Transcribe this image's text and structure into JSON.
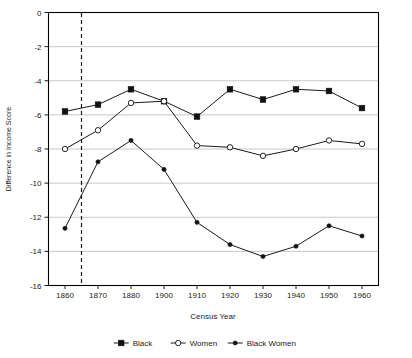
{
  "chart_data": {
    "type": "line",
    "title": "",
    "xlabel": "Census Year",
    "ylabel": "Difference in Income Score",
    "categories": [
      "1860",
      "1870",
      "1880",
      "1900",
      "1910",
      "1920",
      "1930",
      "1940",
      "1950",
      "1960"
    ],
    "x": [
      1860,
      1870,
      1880,
      1900,
      1910,
      1920,
      1930,
      1940,
      1950,
      1960
    ],
    "ylim": [
      -16,
      0
    ],
    "xlim_labels": [
      "1860",
      "1960"
    ],
    "yticks": [
      0,
      -2,
      -4,
      -6,
      -8,
      -10,
      -12,
      -14,
      -16
    ],
    "ytick_labels": [
      "0",
      "-2",
      "-4",
      "-6",
      "-8",
      "-10",
      "-12",
      "-14",
      "-16"
    ],
    "grid": true,
    "grid_axis": "y",
    "legend_position": "bottom",
    "annotations": [
      {
        "kind": "vertical-dashed-line",
        "x": 1865,
        "label": "",
        "note": "dashed reference line between 1860 and 1870"
      }
    ],
    "series": [
      {
        "name": "Black",
        "marker": "filled-square",
        "color": "#111111",
        "values": [
          -5.8,
          -5.4,
          -4.5,
          -5.2,
          -6.1,
          -4.5,
          -5.1,
          -4.5,
          -4.6,
          -5.6
        ]
      },
      {
        "name": "Women",
        "marker": "open-circle",
        "color": "#111111",
        "values": [
          -8.0,
          -6.9,
          -5.3,
          -5.2,
          -7.8,
          -7.9,
          -8.4,
          -8.0,
          -7.5,
          -7.7
        ]
      },
      {
        "name": "Black Women",
        "marker": "small-filled-circle",
        "color": "#111111",
        "values": [
          -12.65,
          -8.75,
          -7.5,
          -9.2,
          -12.3,
          -13.6,
          -14.3,
          -13.7,
          -12.5,
          -13.1
        ]
      }
    ]
  },
  "legend": {
    "items": [
      {
        "label": "Black"
      },
      {
        "label": "Women"
      },
      {
        "label": "Black Women"
      }
    ]
  },
  "axes": {
    "x_title": "Census Year",
    "y_title": "Difference in Income Score"
  }
}
